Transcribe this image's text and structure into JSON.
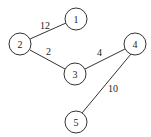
{
  "graph": {
    "nodes": [
      {
        "id": "1",
        "x": 76,
        "y": 19
      },
      {
        "id": "2",
        "x": 20,
        "y": 44
      },
      {
        "id": "3",
        "x": 75,
        "y": 74
      },
      {
        "id": "4",
        "x": 135,
        "y": 44
      },
      {
        "id": "5",
        "x": 76,
        "y": 122
      }
    ],
    "edges": [
      {
        "from": "2",
        "to": "1",
        "weight": "12"
      },
      {
        "from": "2",
        "to": "3",
        "weight": "2"
      },
      {
        "from": "3",
        "to": "4",
        "weight": "4"
      },
      {
        "from": "4",
        "to": "5",
        "weight": "10"
      }
    ]
  }
}
